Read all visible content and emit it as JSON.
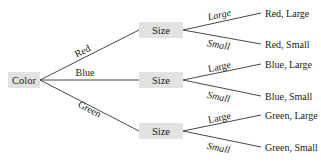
{
  "diagram": {
    "type": "tree",
    "root": {
      "label": "Color"
    },
    "branches": [
      {
        "edge_label": "Red",
        "node_label": "Size",
        "children": [
          {
            "edge_label": "Large",
            "leaf_label": "Red, Large"
          },
          {
            "edge_label": "Small",
            "leaf_label": "Red, Small"
          }
        ]
      },
      {
        "edge_label": "Blue",
        "node_label": "Size",
        "children": [
          {
            "edge_label": "Large",
            "leaf_label": "Blue, Large"
          },
          {
            "edge_label": "Small",
            "leaf_label": "Blue, Small"
          }
        ]
      },
      {
        "edge_label": "Green",
        "node_label": "Size",
        "children": [
          {
            "edge_label": "Large",
            "leaf_label": "Green, Large"
          },
          {
            "edge_label": "Small",
            "leaf_label": "Green, Small"
          }
        ]
      }
    ]
  },
  "colors": {
    "node_fill": "#e2e2e2",
    "line": "#333333",
    "text": "#1a1a1a"
  }
}
